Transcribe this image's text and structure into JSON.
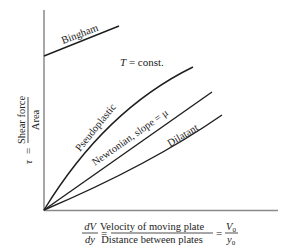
{
  "diagram": {
    "y_axis": {
      "symbol": "τ",
      "equals": "=",
      "numerator": "Shear force",
      "denominator": "Area"
    },
    "x_axis": {
      "lhs_num": "dV",
      "lhs_den": "dy",
      "eq1": "=",
      "mid_num": "Velocity of moving plate",
      "mid_den": "Distance between plates",
      "eq2": "=",
      "rhs_num": "V",
      "rhs_num_sub": "0",
      "rhs_den": "y",
      "rhs_den_sub": "0"
    },
    "annotation": {
      "italic": "T",
      "rest": " = const."
    },
    "curves": [
      {
        "name": "Bingham",
        "label": "Bingham",
        "type": "linear with yield stress"
      },
      {
        "name": "Pseudoplastic",
        "label": "Pseudoplastic",
        "type": "concave down"
      },
      {
        "name": "Newtonian",
        "label": "Newtonian, slope = μ",
        "type": "linear"
      },
      {
        "name": "Dilatant",
        "label": "Dilatant",
        "type": "concave up"
      }
    ],
    "colors": {
      "axis": "#8a8a8a",
      "curve": "#1e1e1e",
      "text": "#222222"
    }
  }
}
